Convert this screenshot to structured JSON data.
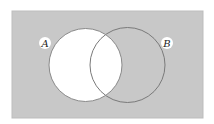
{
  "diagram": {
    "type": "venn",
    "universe": {
      "x": 12,
      "y": 11,
      "width": 191,
      "height": 107,
      "fill": "#c8c8c8",
      "border": "#b8b8b8"
    },
    "sets": [
      {
        "name": "A",
        "label": "A",
        "cx": 85.5,
        "cy": 65,
        "r": 36.5,
        "label_x": 45,
        "label_y": 43
      },
      {
        "name": "B",
        "label": "B",
        "cx": 127.5,
        "cy": 65,
        "r": 37.5,
        "label_x": 167,
        "label_y": 43
      }
    ],
    "shaded_region": "complement of A (A' shaded gray; A unshaded)",
    "unshaded_fill": "#ffffff",
    "outline_color": "#7a7a7a",
    "label_bg": "#ffffff"
  }
}
